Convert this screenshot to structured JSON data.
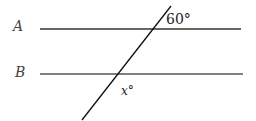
{
  "diagram": {
    "lines": [
      {
        "id": "A",
        "label": "A",
        "x1": 40,
        "y1": 29,
        "x2": 241,
        "y2": 29,
        "color": "#333333"
      },
      {
        "id": "B",
        "label": "B",
        "x1": 40,
        "y1": 74,
        "x2": 243,
        "y2": 74,
        "color": "#555555"
      }
    ],
    "transversal": {
      "x1": 171,
      "y1": 6,
      "x2": 82,
      "y2": 120,
      "color": "#111111"
    },
    "angles": {
      "top": {
        "text": "60°",
        "x": 166,
        "y": 24
      },
      "bottom": {
        "text": "x°",
        "x": 121,
        "y": 95
      }
    }
  }
}
